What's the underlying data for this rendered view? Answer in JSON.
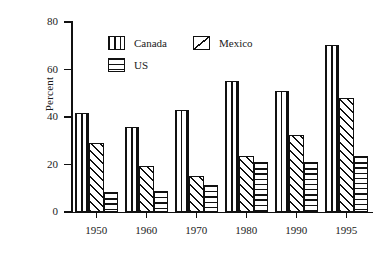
{
  "chart_data": {
    "type": "bar",
    "title": "",
    "subtitle": "",
    "xlabel": "",
    "ylabel": "Percent",
    "categories": [
      "1950",
      "1960",
      "1970",
      "1980",
      "1990",
      "1995"
    ],
    "series": [
      {
        "name": "Canada",
        "pattern": "vertical-stripes",
        "values": [
          41.5,
          36.0,
          43.0,
          55.0,
          51.0,
          70.5
        ]
      },
      {
        "name": "Mexico",
        "pattern": "diagonal-stripes",
        "values": [
          29.0,
          19.5,
          15.0,
          23.5,
          32.5,
          48.0
        ]
      },
      {
        "name": "US",
        "pattern": "horizontal-stripes",
        "values": [
          8.5,
          9.0,
          11.5,
          21.0,
          21.0,
          23.5
        ]
      }
    ],
    "ylim": [
      0,
      80
    ],
    "yticks": [
      0,
      20,
      40,
      60,
      80
    ],
    "ytick_labels": [
      "0",
      "20",
      "40",
      "60",
      "80"
    ],
    "xtick_labels": [
      "1950",
      "1960",
      "1970",
      "1980",
      "1990",
      "1995"
    ],
    "grid": false,
    "legend_position": "upper-left-inside",
    "legend_entries": [
      "Canada",
      "Mexico",
      "US"
    ],
    "color_line": "#111111",
    "color_background": "#ffffff"
  },
  "axis": {
    "y_label": "Percent",
    "y_ticks": [
      "0",
      "20",
      "40",
      "60",
      "80"
    ],
    "x_ticks": [
      "1950",
      "1960",
      "1970",
      "1980",
      "1990",
      "1995"
    ]
  },
  "legend": {
    "canada": "Canada",
    "mexico": "Mexico",
    "us": "US"
  }
}
